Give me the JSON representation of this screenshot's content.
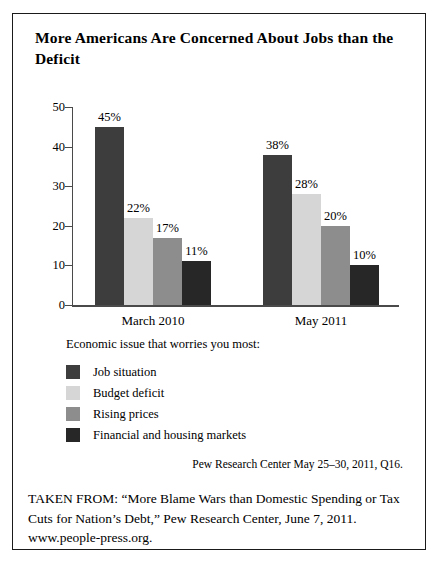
{
  "figure": {
    "title": "More Americans Are Concerned About Jobs than the Deficit",
    "source_note": "Pew Research Center May 25–30, 2011, Q16.",
    "caption": "TAKEN FROM: “More Blame Wars than Domestic Spending or Tax Cuts for Nation’s Debt,” Pew Research Center, June 7, 2011. www.people-press.org."
  },
  "legend": {
    "title": "Economic issue that worries you most:",
    "items": [
      {
        "label": "Job situation",
        "color": "#3d3d3d"
      },
      {
        "label": "Budget deficit",
        "color": "#d6d6d6"
      },
      {
        "label": "Rising prices",
        "color": "#8d8d8d"
      },
      {
        "label": "Financial and housing markets",
        "color": "#272727"
      }
    ]
  },
  "chart_data": {
    "type": "bar",
    "title": "More Americans Are Concerned About Jobs than the Deficit",
    "xlabel": "",
    "ylabel": "",
    "ylim": [
      0,
      50
    ],
    "yticks": [
      0,
      10,
      20,
      30,
      40,
      50
    ],
    "ytick_labels": [
      "0",
      "10",
      "20",
      "30",
      "40",
      "50"
    ],
    "grid": false,
    "legend_position": "below-plot",
    "value_suffix": "%",
    "categories": [
      "March 2010",
      "May 2011"
    ],
    "series": [
      {
        "name": "Job situation",
        "color": "#3d3d3d",
        "values": [
          45,
          38
        ],
        "labels": [
          "45%",
          "38%"
        ]
      },
      {
        "name": "Budget deficit",
        "color": "#d6d6d6",
        "values": [
          22,
          28
        ],
        "labels": [
          "22%",
          "28%"
        ]
      },
      {
        "name": "Rising prices",
        "color": "#8d8d8d",
        "values": [
          17,
          20
        ],
        "labels": [
          "17%",
          "20%"
        ]
      },
      {
        "name": "Financial and housing markets",
        "color": "#272727",
        "values": [
          11,
          10
        ],
        "labels": [
          "11%",
          "10%"
        ]
      }
    ]
  }
}
